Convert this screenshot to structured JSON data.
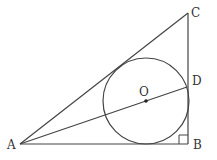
{
  "diagram": {
    "type": "geometry",
    "colors": {
      "stroke": "#444444",
      "label": "#333333",
      "background": "#ffffff"
    },
    "labels": {
      "A": "A",
      "B": "B",
      "C": "C",
      "D": "D",
      "O": "O"
    },
    "points": {
      "A": [
        20,
        144
      ],
      "B": [
        188,
        144
      ],
      "C": [
        188,
        13
      ],
      "D": [
        187,
        87
      ],
      "O": [
        146,
        100
      ]
    },
    "circle": {
      "center": "O",
      "radius": 43
    },
    "segments": [
      "AB",
      "BC",
      "CA",
      "AD"
    ],
    "right_angle_at": "B"
  }
}
